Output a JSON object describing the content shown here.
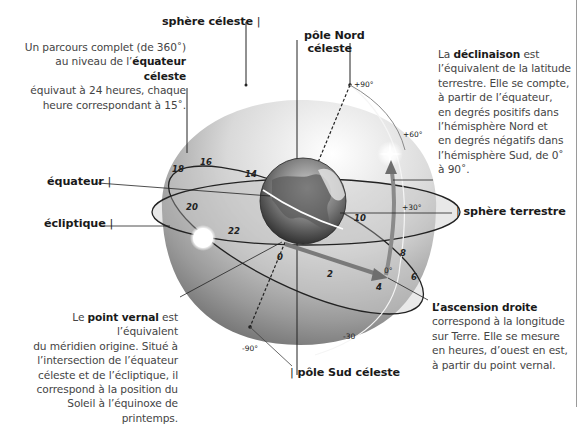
{
  "labels": {
    "sphere_celeste": "sphère céleste",
    "pole_nord": "pôle Nord",
    "pole_nord_2": "céleste",
    "equateur": "équateur",
    "ecliptique": "écliptique",
    "sphere_terrestre": "sphère terrestre",
    "pole_sud": "pôle Sud céleste"
  },
  "paragraphs": {
    "parcours": {
      "line1": "Un parcours complet (de 360˚)",
      "line2_pre": "au niveau de l’",
      "line2_bold": "équateur céleste",
      "line3": "équivaut à 24 heures, chaque",
      "line4": "heure correspondant à 15˚."
    },
    "declinaison": {
      "pre": "La ",
      "bold": "déclinaison",
      "post": " est",
      "lines": [
        "l’équivalent de la latitude",
        "terrestre. Elle se compte,",
        "à partir de l’équateur,",
        "en degrés positifs dans",
        "l’hémisphère Nord et",
        "en degrés négatifs dans",
        "l’hémisphère Sud, de 0˚",
        "à 90˚."
      ]
    },
    "point_vernal": {
      "pre": "Le ",
      "bold": "point vernal",
      "post": " est l’équivalent",
      "lines": [
        "du méridien origine. Situé à",
        "l’intersection de l’équateur",
        "céleste et de l’écliptique, il",
        "correspond à la position du",
        "Soleil à l’équinoxe de printemps."
      ]
    },
    "ascension": {
      "bold": "L’ascension droite",
      "lines": [
        "correspond à la longitude",
        "sur Terre. Elle se mesure",
        "en heures, d’ouest en est,",
        "à partir du point vernal."
      ]
    }
  },
  "hour_ticks": [
    "18",
    "16",
    "14",
    "20",
    "22",
    "0",
    "2",
    "4",
    "6",
    "8",
    "10"
  ],
  "declination_ticks": [
    "+90°",
    "+60°",
    "+30°",
    "0°",
    "-30",
    "-90°"
  ],
  "colors": {
    "sphere_light": "#f4f4f4",
    "sphere_dark": "#7a7a7a",
    "arrow": "#8a8a8a",
    "line": "#222222"
  }
}
